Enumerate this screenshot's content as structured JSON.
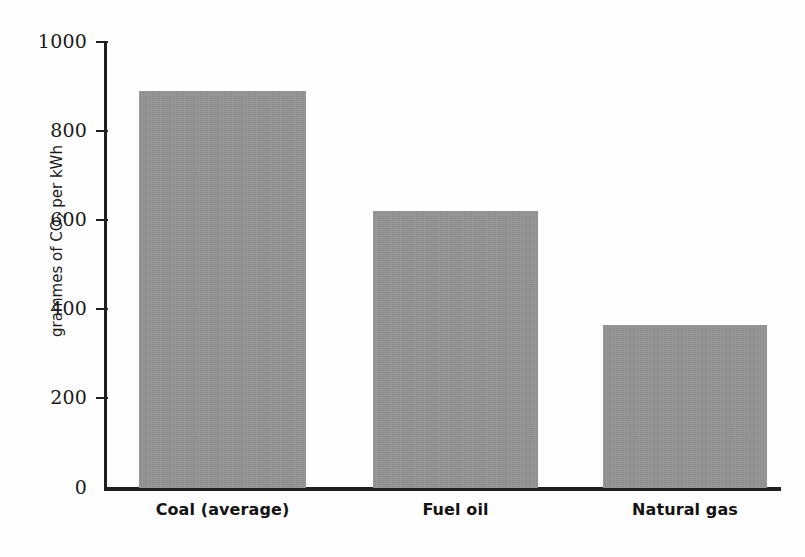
{
  "chart_data": {
    "type": "bar",
    "title": "",
    "subtitle": "",
    "xlabel": "",
    "ylabel": "grammes of CO2 per kWh",
    "ylabel_prefix": "grammes of CO",
    "ylabel_sub": "2",
    "ylabel_suffix": " per kWh",
    "categories": [
      "Coal (average)",
      "Fuel oil",
      "Natural gas"
    ],
    "values": [
      890,
      620,
      365
    ],
    "ylim": [
      0,
      1000
    ],
    "yticks": [
      1000,
      800,
      600,
      400,
      200,
      0
    ],
    "ytick_labels": [
      "1000",
      "800",
      "600",
      "400",
      "200",
      "0"
    ],
    "grid": false,
    "legend": null,
    "bar_color": "#949494",
    "axis_color": "#1f1f1f",
    "text_color": "#1a1a1a",
    "background_color": "#fefefe"
  },
  "bars": [
    {
      "label": "Coal (average)",
      "value": 890
    },
    {
      "label": "Fuel oil",
      "value": 620
    },
    {
      "label": "Natural gas",
      "value": 365
    }
  ]
}
